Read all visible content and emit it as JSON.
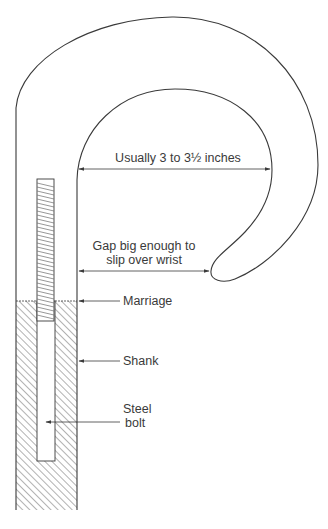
{
  "diagram": {
    "colors": {
      "line": "#3a3a3a",
      "hatch": "#555555",
      "background": "#ffffff"
    },
    "labels": {
      "crook_width": "Usually 3 to 3½ inches",
      "gap_line1": "Gap big enough to",
      "gap_line2": "slip over wrist",
      "marriage": "Marriage",
      "shank": "Shank",
      "bolt_line1": "Steel",
      "bolt_line2": "bolt"
    },
    "annotations": [
      {
        "id": "crook-width",
        "type": "double-arrow",
        "text_ref": "labels.crook_width"
      },
      {
        "id": "gap",
        "type": "double-arrow",
        "text_ref": "labels.gap_line1 + labels.gap_line2"
      },
      {
        "id": "marriage",
        "type": "leader-arrow",
        "text_ref": "labels.marriage"
      },
      {
        "id": "shank",
        "type": "leader-arrow",
        "text_ref": "labels.shank"
      },
      {
        "id": "steel-bolt",
        "type": "leader-arrow",
        "text_ref": "labels.bolt_line1 + labels.bolt_line2"
      }
    ]
  }
}
